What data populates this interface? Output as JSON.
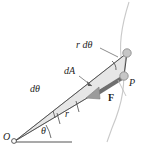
{
  "figure": {
    "background_color": "#ffffff",
    "width": 144,
    "height": 152,
    "colors": {
      "line": "#3a3a3a",
      "thin_line": "#6b6b6b",
      "arc_curve": "#c9c9c9",
      "wedge_fill": "#e3e3e3",
      "wedge_stroke": "#8a8a8a",
      "force_arrow": "#8f8f8f",
      "force_arrow_dark": "#5a5a5a",
      "marker_fill": "#c4c4c4",
      "marker_stroke": "#8a8a8a",
      "text": "#1d1d1d"
    },
    "labels": {
      "r_dtheta": "r dθ",
      "dA": "dA",
      "dtheta": "dθ",
      "r": "r",
      "theta": "θ",
      "origin": "O",
      "point_p": "P",
      "force": "F"
    },
    "elements": {
      "origin_marker": "origin-circle",
      "upper_marker": "upper-path-node",
      "p_marker": "point-p-node",
      "baseline": "horizontal-reference-axis",
      "angle_arc": "theta-angle-arc",
      "right_angle_arc": "r-dtheta-angle-arc",
      "path_curve": "particle-path-curve",
      "wedge": "swept-area-wedge",
      "force_vector": "force-vector-arrow",
      "leader_rdtheta": "leader-line-r-dtheta",
      "leader_dA": "leader-line-dA",
      "leader_p": "leader-line-p",
      "tick_marks": "radius-tick-marks"
    }
  }
}
